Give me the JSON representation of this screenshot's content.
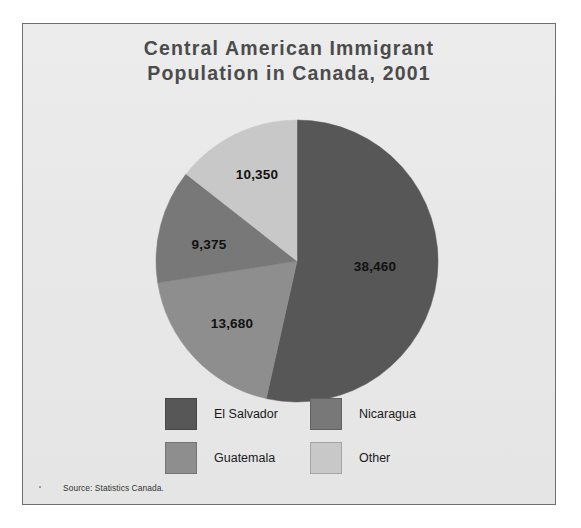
{
  "figure": {
    "title_lines": [
      "Central American Immigrant",
      "Population in Canada, 2001"
    ],
    "source": "Source: Statistics Canada.",
    "panel_color": "#e8e8e8",
    "border_color": "#6f6f6f",
    "title_color": "#4b4b4b"
  },
  "chart_data": {
    "type": "pie",
    "title": "Central American Immigrant Population in Canada, 2001",
    "xlabel": "",
    "ylabel": "",
    "total": 71865,
    "units": "persons",
    "start_angle_deg": 0,
    "direction": "clockwise",
    "grid": false,
    "legend_position": "bottom",
    "data_labels_inside": true,
    "categories": [
      "El Salvador",
      "Guatemala",
      "Nicaragua",
      "Other"
    ],
    "values": [
      38460,
      13680,
      9375,
      10350
    ],
    "value_labels": [
      "38,460",
      "13,680",
      "9,375",
      "10,350"
    ],
    "percentages": [
      53.5,
      19.0,
      13.0,
      14.4
    ],
    "angles_deg": [
      192.6,
      68.5,
      47.0,
      51.9
    ],
    "colors": [
      "#575757",
      "#8e8e8e",
      "#787878",
      "#c8c8c8"
    ],
    "slices": [
      {
        "name": "El Salvador",
        "value": 38460,
        "label": "38,460",
        "percent": 53.5,
        "color": "#575757",
        "start_deg": 0,
        "end_deg": 192.6,
        "label_x": 352,
        "label_y": 242
      },
      {
        "name": "Guatemala",
        "value": 13680,
        "label": "13,680",
        "percent": 19.0,
        "color": "#8e8e8e",
        "start_deg": 192.6,
        "end_deg": 261.1,
        "label_x": 209,
        "label_y": 299
      },
      {
        "name": "Nicaragua",
        "value": 9375,
        "label": "9,375",
        "percent": 13.0,
        "color": "#787878",
        "start_deg": 261.1,
        "end_deg": 308.1,
        "label_x": 186,
        "label_y": 220
      },
      {
        "name": "Other",
        "value": 10350,
        "label": "10,350",
        "percent": 14.4,
        "color": "#c8c8c8",
        "start_deg": 308.1,
        "end_deg": 360,
        "label_x": 234,
        "label_y": 150
      }
    ],
    "geometry": {
      "cx": 274,
      "cy": 237,
      "r": 141
    }
  },
  "legend": {
    "rows": [
      [
        {
          "label": "El Salvador",
          "color": "#575757"
        },
        {
          "label": "Nicaragua",
          "color": "#787878"
        }
      ],
      [
        {
          "label": "Guatemala",
          "color": "#8e8e8e"
        },
        {
          "label": "Other",
          "color": "#c8c8c8"
        }
      ]
    ]
  }
}
